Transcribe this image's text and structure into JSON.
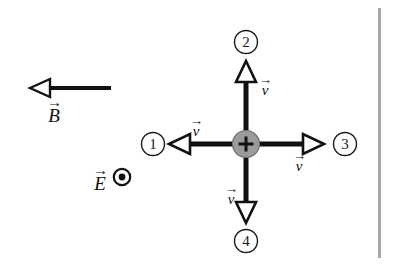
{
  "figure": {
    "background_color": "#ffffff",
    "width": 397,
    "height": 268
  },
  "fields": {
    "magnetic": {
      "symbol": "B",
      "accent": "→",
      "direction": "left",
      "arrow_head": "hollow",
      "color": "#111111"
    },
    "electric": {
      "symbol": "E",
      "accent": "→",
      "direction": "out-of-page",
      "marker": "dot-in-circle",
      "color": "#111111"
    }
  },
  "charge": {
    "sign": "+",
    "fill_color": "#999999",
    "stroke_color": "#6e6e6e",
    "plus_color": "#111111"
  },
  "velocity_options": [
    {
      "id": "1",
      "number": "1",
      "direction": "left",
      "label_symbol": "v",
      "label_accent": "→",
      "label_position": "above"
    },
    {
      "id": "2",
      "number": "2",
      "direction": "up",
      "label_symbol": "v",
      "label_accent": "→",
      "label_position": "right"
    },
    {
      "id": "3",
      "number": "3",
      "direction": "right",
      "label_symbol": "v",
      "label_accent": "→",
      "label_position": "below"
    },
    {
      "id": "4",
      "number": "4",
      "direction": "down",
      "label_symbol": "v",
      "label_accent": "→",
      "label_position": "left"
    }
  ],
  "edge_rule": {
    "color": "#a8a8a8",
    "orientation": "vertical"
  }
}
